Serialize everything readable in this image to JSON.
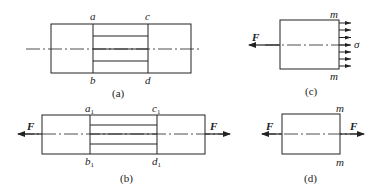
{
  "figures": {
    "a": {
      "caption": "(a)",
      "labels": {
        "top_left": "a",
        "top_right": "c",
        "bottom_left": "b",
        "bottom_right": "d"
      }
    },
    "b": {
      "caption": "(b)",
      "labels": {
        "top_left": "a",
        "top_right": "c",
        "bottom_left": "b",
        "bottom_right": "d",
        "subscript": "1"
      },
      "force_left": "F",
      "force_right": "F"
    },
    "c": {
      "caption": "(c)",
      "section_top": "m",
      "section_bottom": "m",
      "force": "F",
      "stress": "σ",
      "stress_arrow_count": 7
    },
    "d": {
      "caption": "(d)",
      "section_top": "m",
      "section_bottom": "m",
      "force_left": "F",
      "force_right": "F"
    }
  },
  "colors": {
    "stroke": "#222222",
    "background": "#ffffff"
  }
}
